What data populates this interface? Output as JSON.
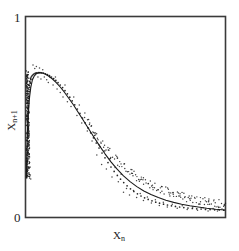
{
  "figure": {
    "name": "return-map-scatter-plot",
    "background": "#ffffff",
    "frame_color": "#3a3a3a",
    "point_color": "#1a1a1a"
  },
  "axes": {
    "x_title_base": "X",
    "x_title_sub": "n",
    "y_title_base": "X",
    "y_title_sub": "n+1",
    "y_tick_max": "1",
    "y_tick_min": "0"
  },
  "chart_data": {
    "type": "scatter",
    "title": "",
    "xlabel": "X_n",
    "ylabel": "X_n+1",
    "xlim": [
      0,
      1
    ],
    "ylim": [
      0,
      1
    ],
    "grid": false,
    "legend": null,
    "xticks": [],
    "yticks": [
      0,
      1
    ],
    "ytick_labels": [
      "0",
      "1"
    ],
    "series": [
      {
        "name": "orbit points",
        "marker": "dot",
        "color": "#1a1a1a",
        "points": [
          [
            0.005,
            0.205
          ],
          [
            0.004,
            0.225
          ],
          [
            0.006,
            0.245
          ],
          [
            0.005,
            0.262
          ],
          [
            0.007,
            0.278
          ],
          [
            0.004,
            0.292
          ],
          [
            0.006,
            0.308
          ],
          [
            0.008,
            0.322
          ],
          [
            0.005,
            0.338
          ],
          [
            0.007,
            0.352
          ],
          [
            0.009,
            0.366
          ],
          [
            0.006,
            0.381
          ],
          [
            0.008,
            0.395
          ],
          [
            0.01,
            0.409
          ],
          [
            0.007,
            0.423
          ],
          [
            0.009,
            0.437
          ],
          [
            0.011,
            0.451
          ],
          [
            0.008,
            0.464
          ],
          [
            0.01,
            0.478
          ],
          [
            0.012,
            0.491
          ],
          [
            0.009,
            0.504
          ],
          [
            0.011,
            0.517
          ],
          [
            0.013,
            0.53
          ],
          [
            0.01,
            0.543
          ],
          [
            0.012,
            0.556
          ],
          [
            0.014,
            0.568
          ],
          [
            0.011,
            0.58
          ],
          [
            0.013,
            0.592
          ],
          [
            0.016,
            0.604
          ],
          [
            0.014,
            0.616
          ],
          [
            0.017,
            0.627
          ],
          [
            0.015,
            0.638
          ],
          [
            0.019,
            0.649
          ],
          [
            0.017,
            0.659
          ],
          [
            0.021,
            0.669
          ],
          [
            0.019,
            0.678
          ],
          [
            0.024,
            0.687
          ],
          [
            0.022,
            0.694
          ],
          [
            0.027,
            0.701
          ],
          [
            0.031,
            0.707
          ],
          [
            0.036,
            0.712
          ],
          [
            0.041,
            0.716
          ],
          [
            0.047,
            0.719
          ],
          [
            0.054,
            0.721
          ],
          [
            0.062,
            0.722
          ],
          [
            0.07,
            0.722
          ],
          [
            0.079,
            0.721
          ],
          [
            0.088,
            0.719
          ],
          [
            0.098,
            0.716
          ],
          [
            0.108,
            0.712
          ],
          [
            0.118,
            0.707
          ],
          [
            0.128,
            0.7
          ],
          [
            0.139,
            0.692
          ],
          [
            0.15,
            0.683
          ],
          [
            0.161,
            0.672
          ],
          [
            0.172,
            0.66
          ],
          [
            0.184,
            0.647
          ],
          [
            0.196,
            0.632
          ],
          [
            0.208,
            0.616
          ],
          [
            0.22,
            0.599
          ],
          [
            0.232,
            0.581
          ],
          [
            0.245,
            0.561
          ],
          [
            0.258,
            0.54
          ],
          [
            0.271,
            0.518
          ],
          [
            0.284,
            0.495
          ],
          [
            0.297,
            0.471
          ],
          [
            0.311,
            0.446
          ],
          [
            0.325,
            0.421
          ],
          [
            0.339,
            0.396
          ],
          [
            0.353,
            0.37
          ],
          [
            0.367,
            0.345
          ],
          [
            0.382,
            0.32
          ],
          [
            0.397,
            0.296
          ],
          [
            0.412,
            0.272
          ],
          [
            0.427,
            0.25
          ],
          [
            0.443,
            0.228
          ],
          [
            0.459,
            0.208
          ],
          [
            0.475,
            0.189
          ],
          [
            0.491,
            0.172
          ],
          [
            0.508,
            0.156
          ],
          [
            0.525,
            0.141
          ],
          [
            0.542,
            0.128
          ],
          [
            0.56,
            0.116
          ],
          [
            0.578,
            0.105
          ],
          [
            0.596,
            0.096
          ],
          [
            0.614,
            0.088
          ],
          [
            0.633,
            0.081
          ],
          [
            0.652,
            0.074
          ],
          [
            0.671,
            0.069
          ],
          [
            0.691,
            0.064
          ],
          [
            0.711,
            0.06
          ],
          [
            0.731,
            0.056
          ],
          [
            0.751,
            0.053
          ],
          [
            0.772,
            0.05
          ],
          [
            0.793,
            0.047
          ],
          [
            0.814,
            0.045
          ],
          [
            0.836,
            0.043
          ],
          [
            0.858,
            0.041
          ],
          [
            0.88,
            0.04
          ],
          [
            0.902,
            0.038
          ],
          [
            0.925,
            0.037
          ],
          [
            0.948,
            0.036
          ],
          [
            0.971,
            0.035
          ],
          [
            0.994,
            0.034
          ]
        ],
        "noise_points": [
          [
            0.035,
            0.76
          ],
          [
            0.052,
            0.752
          ],
          [
            0.068,
            0.745
          ],
          [
            0.084,
            0.736
          ],
          [
            0.044,
            0.742
          ],
          [
            0.06,
            0.7
          ],
          [
            0.075,
            0.69
          ],
          [
            0.03,
            0.69
          ],
          [
            0.022,
            0.672
          ],
          [
            0.092,
            0.7
          ],
          [
            0.104,
            0.686
          ],
          [
            0.112,
            0.672
          ],
          [
            0.12,
            0.7
          ],
          [
            0.136,
            0.66
          ],
          [
            0.148,
            0.7
          ],
          [
            0.156,
            0.64
          ],
          [
            0.172,
            0.622
          ],
          [
            0.186,
            0.6
          ],
          [
            0.196,
            0.66
          ],
          [
            0.208,
            0.576
          ],
          [
            0.226,
            0.552
          ],
          [
            0.24,
            0.6
          ],
          [
            0.256,
            0.508
          ],
          [
            0.268,
            0.56
          ],
          [
            0.28,
            0.47
          ],
          [
            0.296,
            0.52
          ],
          [
            0.308,
            0.43
          ],
          [
            0.32,
            0.47
          ],
          [
            0.332,
            0.38
          ],
          [
            0.344,
            0.42
          ],
          [
            0.356,
            0.31
          ],
          [
            0.368,
            0.36
          ],
          [
            0.38,
            0.262
          ],
          [
            0.392,
            0.33
          ],
          [
            0.404,
            0.24
          ],
          [
            0.42,
            0.29
          ],
          [
            0.432,
            0.2
          ],
          [
            0.448,
            0.248
          ],
          [
            0.464,
            0.176
          ],
          [
            0.478,
            0.214
          ],
          [
            0.012,
            0.6
          ],
          [
            0.014,
            0.52
          ],
          [
            0.01,
            0.44
          ],
          [
            0.016,
            0.36
          ],
          [
            0.018,
            0.3
          ],
          [
            0.02,
            0.25
          ],
          [
            0.022,
            0.21
          ],
          [
            0.024,
            0.19
          ],
          [
            0.49,
            0.124
          ],
          [
            0.505,
            0.142
          ],
          [
            0.52,
            0.11
          ],
          [
            0.54,
            0.132
          ],
          [
            0.556,
            0.098
          ],
          [
            0.574,
            0.118
          ],
          [
            0.59,
            0.082
          ],
          [
            0.61,
            0.1
          ],
          [
            0.63,
            0.07
          ],
          [
            0.65,
            0.086
          ],
          [
            0.67,
            0.058
          ],
          [
            0.69,
            0.074
          ],
          [
            0.71,
            0.05
          ],
          [
            0.735,
            0.064
          ],
          [
            0.76,
            0.044
          ],
          [
            0.785,
            0.056
          ],
          [
            0.81,
            0.038
          ],
          [
            0.838,
            0.05
          ],
          [
            0.862,
            0.034
          ],
          [
            0.89,
            0.046
          ],
          [
            0.915,
            0.03
          ],
          [
            0.94,
            0.042
          ],
          [
            0.962,
            0.03
          ],
          [
            0.985,
            0.04
          ]
        ]
      },
      {
        "name": "fitted unimodal curve",
        "type": "line",
        "color": "#1a1a1a",
        "points": [
          [
            0.002,
            0.195
          ],
          [
            0.004,
            0.3
          ],
          [
            0.006,
            0.39
          ],
          [
            0.009,
            0.47
          ],
          [
            0.013,
            0.54
          ],
          [
            0.018,
            0.6
          ],
          [
            0.024,
            0.648
          ],
          [
            0.032,
            0.685
          ],
          [
            0.042,
            0.706
          ],
          [
            0.054,
            0.718
          ],
          [
            0.068,
            0.722
          ],
          [
            0.082,
            0.72
          ],
          [
            0.098,
            0.714
          ],
          [
            0.115,
            0.704
          ],
          [
            0.133,
            0.69
          ],
          [
            0.152,
            0.672
          ],
          [
            0.172,
            0.65
          ],
          [
            0.193,
            0.624
          ],
          [
            0.215,
            0.594
          ],
          [
            0.238,
            0.561
          ],
          [
            0.262,
            0.524
          ],
          [
            0.287,
            0.485
          ],
          [
            0.313,
            0.444
          ],
          [
            0.34,
            0.401
          ],
          [
            0.368,
            0.358
          ],
          [
            0.397,
            0.316
          ],
          [
            0.427,
            0.276
          ],
          [
            0.458,
            0.239
          ],
          [
            0.49,
            0.206
          ],
          [
            0.523,
            0.177
          ],
          [
            0.557,
            0.152
          ],
          [
            0.592,
            0.13
          ],
          [
            0.628,
            0.112
          ],
          [
            0.665,
            0.097
          ],
          [
            0.703,
            0.084
          ],
          [
            0.742,
            0.073
          ],
          [
            0.782,
            0.064
          ],
          [
            0.823,
            0.056
          ],
          [
            0.865,
            0.05
          ],
          [
            0.908,
            0.044
          ],
          [
            0.952,
            0.039
          ],
          [
            0.998,
            0.035
          ]
        ]
      }
    ]
  }
}
